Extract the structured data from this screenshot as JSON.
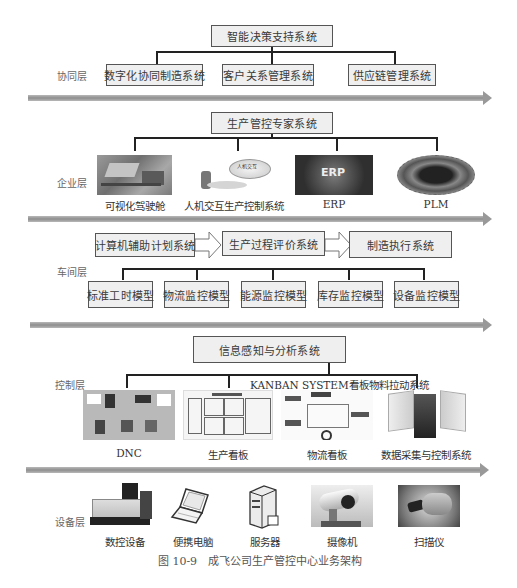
{
  "layers": {
    "collaboration": {
      "label": "协同层",
      "top_box": "智能决策支持系统",
      "boxes": [
        "数字化协同制造系统",
        "客户关系管理系统",
        "供应链管理系统"
      ]
    },
    "enterprise": {
      "label": "企业层",
      "top_box": "生产管控专家系统",
      "items": [
        {
          "caption": "可视化驾驶舱"
        },
        {
          "caption": "人机交互生产控制系统",
          "inner_label": "人机交互"
        },
        {
          "caption": "ERP",
          "inner_label": "ERP"
        },
        {
          "caption": "PLM"
        }
      ]
    },
    "workshop": {
      "label": "车间层",
      "flow_boxes": [
        "计算机辅助计划系统",
        "生产过程评价系统",
        "制造执行系统"
      ],
      "models": [
        "标准工时模型",
        "物流监控模型",
        "能源监控模型",
        "库存监控模型",
        "设备监控模型"
      ]
    },
    "control": {
      "label": "控制层",
      "top_box": "信息感知与分析系统",
      "kanban_label": "KANBAN SYSTEM看板物料拉动系统",
      "items": [
        {
          "caption": "DNC"
        },
        {
          "caption": "生产看板"
        },
        {
          "caption": "物流看板"
        },
        {
          "caption": "数据采集与控制系统"
        }
      ]
    },
    "device": {
      "label": "设备层",
      "items": [
        {
          "caption": "数控设备"
        },
        {
          "caption": "便携电脑"
        },
        {
          "caption": "服务器"
        },
        {
          "caption": "摄像机"
        },
        {
          "caption": "扫描仪"
        }
      ]
    }
  },
  "figure_caption": "图 10-9　成飞公司生产管控中心业务架构",
  "colors": {
    "box_fill": "#efefef",
    "box_border": "#555555",
    "connector": "#222222",
    "layer_arrow": "#9a9a9a"
  }
}
